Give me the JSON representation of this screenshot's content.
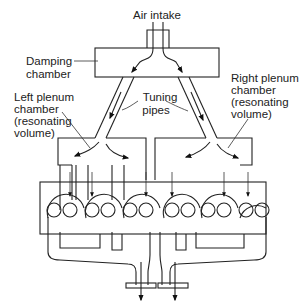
{
  "figure": {
    "kind": "engine intake resonance system schematic",
    "labels": {
      "air_intake": "Air intake",
      "damping_chamber": [
        "Damping",
        "chamber"
      ],
      "tuning_pipes": [
        "Tuning",
        "pipes"
      ],
      "left_plenum": [
        "Left plenum",
        "chamber",
        "(resonating",
        "volume)"
      ],
      "right_plenum": [
        "Right plenum",
        "chamber",
        "(resonating",
        "volume)"
      ]
    },
    "components": [
      "air-intake",
      "damping-chamber",
      "left-tuning-pipe",
      "right-tuning-pipe",
      "left-plenum-chamber",
      "right-plenum-chamber",
      "cylinder-head",
      "exhaust-manifold-left",
      "exhaust-manifold-right"
    ],
    "cylinders_per_bank": 3,
    "colors": {
      "line": "#222222",
      "background": "#ffffff"
    }
  }
}
